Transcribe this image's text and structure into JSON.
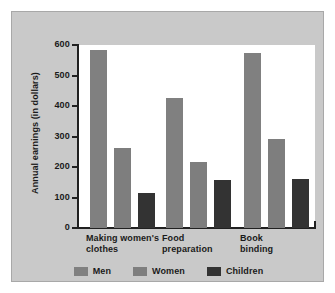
{
  "figure": {
    "panel_background": "#c9c9c9",
    "plot_background": "#ffffff"
  },
  "chart_data": {
    "type": "bar",
    "title": "",
    "subtitle": "",
    "xlabel": "",
    "ylabel": "Annual earnings (in dollars)",
    "categories": [
      "Making women's\nclothes",
      "Food\npreparation",
      "Book\nbinding"
    ],
    "series": [
      {
        "name": "Men",
        "color": "#808080",
        "values": [
          583,
          425,
          575
        ]
      },
      {
        "name": "Women",
        "color": "#7e7e7e",
        "values": [
          263,
          215,
          292
        ]
      },
      {
        "name": "Children",
        "color": "#333333",
        "values": [
          115,
          157,
          160
        ]
      }
    ],
    "ylim": [
      0,
      600
    ],
    "yticks": [
      0,
      100,
      200,
      300,
      400,
      500,
      600
    ],
    "ytick_labels": [
      "0",
      "100",
      "200",
      "300",
      "400",
      "500",
      "600"
    ],
    "grid": false,
    "legend_position": "bottom"
  },
  "legend": {
    "items": [
      {
        "label": "Men",
        "color": "#808080"
      },
      {
        "label": "Women",
        "color": "#7e7e7e"
      },
      {
        "label": "Children",
        "color": "#333333"
      }
    ]
  }
}
